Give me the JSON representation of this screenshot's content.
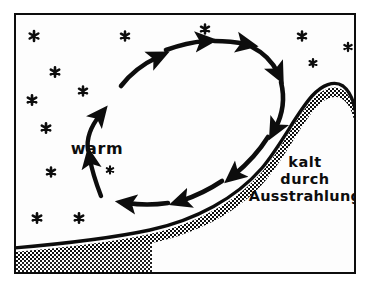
{
  "figure": {
    "kind": "meteorology-diagram",
    "topic": "nocturnal radiative cooling and thermal circulation over a hill",
    "language": "de",
    "background_color": "#ffffff",
    "interior_color": "#fdfdfd",
    "ink_color": "#0d0d0d",
    "frame": {
      "name": "diagram-border",
      "x": 14,
      "y": 13,
      "width": 342,
      "height": 261,
      "stroke_color": "#0d0d0d",
      "stroke_width": 2
    },
    "labels": {
      "warm": "warm",
      "cold_line_1": "kalt",
      "cold_line_2": "durch",
      "cold_line_3": "Ausstrahlung"
    },
    "label_positions": {
      "warm": {
        "x": 97,
        "y": 148,
        "font_size": 15
      },
      "cold": {
        "x": 305,
        "y": 167,
        "line_height": 17,
        "font_size": 14
      }
    },
    "stars": {
      "glyph": "six-pointed-asterisk",
      "color": "#0d0d0d",
      "count": 14,
      "points": [
        {
          "x": 34,
          "y": 36,
          "r": 5.0
        },
        {
          "x": 125,
          "y": 36,
          "r": 4.6
        },
        {
          "x": 205,
          "y": 29,
          "r": 4.6
        },
        {
          "x": 302,
          "y": 36,
          "r": 4.6
        },
        {
          "x": 348,
          "y": 47,
          "r": 4.2
        },
        {
          "x": 55,
          "y": 72,
          "r": 4.8
        },
        {
          "x": 313,
          "y": 63,
          "r": 4.4
        },
        {
          "x": 32,
          "y": 100,
          "r": 4.8
        },
        {
          "x": 83,
          "y": 91,
          "r": 4.6
        },
        {
          "x": 46,
          "y": 128,
          "r": 4.8
        },
        {
          "x": 51,
          "y": 172,
          "r": 4.6
        },
        {
          "x": 37,
          "y": 218,
          "r": 4.8
        },
        {
          "x": 79,
          "y": 218,
          "r": 4.8
        },
        {
          "x": 110,
          "y": 170,
          "r": 4.0
        }
      ]
    },
    "terrain": {
      "name": "ground-profile",
      "description": "thick black ground line rising from lower-left to a rounded hill on the right",
      "line_color": "#0d0d0d",
      "line_width": 3.4,
      "stipple_pattern": "checkerboard-dots",
      "stipple_color": "#0d0d0d",
      "outline_path": "M 14 248 C 60 244 108 239 150 230 C 196 220 236 198 262 168 C 282 144 296 114 312 96 C 322 85 334 80 343 86 C 351 92 354 102 356 114",
      "fill_band_width": 9
    },
    "circulation": {
      "name": "thermal-circulation-loop",
      "direction": "clockwise",
      "segment_count": 9,
      "stroke_color": "#0d0d0d",
      "segments": [
        {
          "id": "arrow-up-left-lower",
          "role": "rising warm air",
          "path": "M 88 150 C 86 136 92 124 100 114",
          "width": 4.6
        },
        {
          "id": "arrow-up-left-upper",
          "role": "rising warm air",
          "path": "M 104 108 C 110 98 122 88 133 80",
          "width": 4.6
        },
        {
          "id": "arrow-upper-left-diag",
          "role": "turning toward crest",
          "path": "M 122 84 C 132 72 146 62 160 56",
          "width": 4.8
        },
        {
          "id": "arrow-top-left",
          "role": "top flow to the right",
          "path": "M 166 50 C 180 44 194 41 206 40",
          "width": 4.8
        },
        {
          "id": "arrow-top-right",
          "role": "top flow to the right",
          "path": "M 214 41 C 226 41 236 42 246 44",
          "width": 4.8
        },
        {
          "id": "arrow-right-upper",
          "role": "descending cold air",
          "path": "M 252 46 C 264 52 272 60 278 72",
          "width": 4.8
        },
        {
          "id": "arrow-right-lower",
          "role": "descending cold air",
          "path": "M 280 80 C 284 96 282 112 274 128",
          "width": 4.8
        },
        {
          "id": "arrow-downslope",
          "role": "katabatic downslope flow",
          "path": "M 268 136 C 258 152 246 164 234 174",
          "width": 4.8
        },
        {
          "id": "arrow-bottom-right",
          "role": "cold air spreading left",
          "path": "M 222 180 C 206 190 192 196 180 200",
          "width": 4.8
        },
        {
          "id": "arrow-bottom-left",
          "role": "cold air spreading left",
          "path": "M 168 202 C 154 204 140 204 126 202",
          "width": 4.6
        },
        {
          "id": "arrow-return-up",
          "role": "return branch rising",
          "path": "M 101 195 C 96 182 92 170 90 158",
          "width": 4.6
        }
      ]
    }
  }
}
